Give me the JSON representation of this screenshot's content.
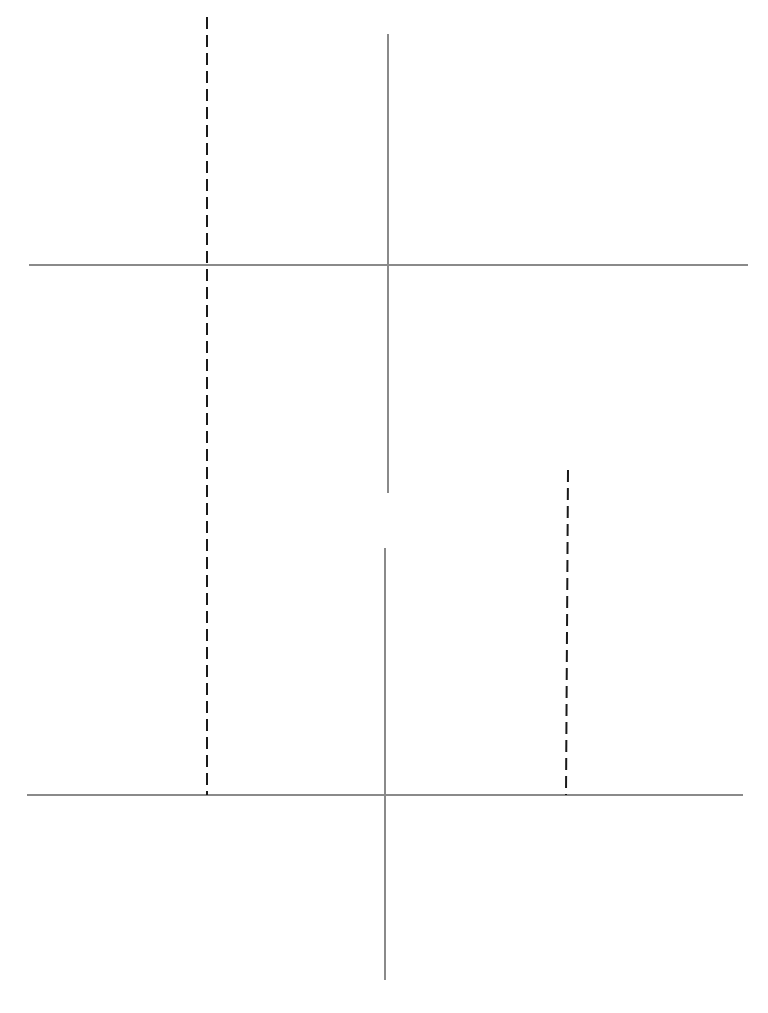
{
  "chart_data": [
    {
      "type": "line",
      "name": "top-chart",
      "title": "",
      "function": "f(x) = x^3/3 - 9x",
      "xlabel": "x",
      "ylabel": "y",
      "xlim": [
        -6,
        6
      ],
      "ylim": [
        -20,
        20
      ],
      "x_ticks": [
        "-6",
        "-4",
        "-2",
        "0",
        "2",
        "4",
        "6"
      ],
      "y_ticks": [
        "20",
        "15",
        "10",
        "5",
        "0",
        "-5",
        "-10",
        "-15",
        "-20"
      ],
      "grid": false,
      "series": [
        {
          "name": "f(x)",
          "x_range": [
            -5,
            5
          ],
          "x": [
            -5,
            -4,
            -3,
            -2,
            -1,
            0,
            1,
            2,
            3,
            4,
            5
          ],
          "y": [
            3.33,
            14.67,
            18,
            15.33,
            8.67,
            0,
            -8.67,
            -15.33,
            -18,
            -14.67,
            -3.33
          ]
        }
      ],
      "annotations": {
        "local_max": {
          "x": -3,
          "y": 18
        },
        "local_min": {
          "x": 3,
          "y": -18
        },
        "tangent_lines": [
          {
            "at": "max",
            "slope": 0,
            "x_from": -4.8,
            "x_to": -1.6
          },
          {
            "at": "left-of-max",
            "x1": -4.9,
            "y1": 8,
            "x2": -3.3,
            "y2": 21.7
          },
          {
            "at": "right-of-max",
            "x1": -2.5,
            "y1": 19.7,
            "x2": -0.8,
            "y2": 8.4
          },
          {
            "at": "min",
            "slope": 0,
            "x_from": 1.3,
            "x_to": 4.9
          },
          {
            "at": "left-of-min",
            "x1": 0.65,
            "y1": -7.7,
            "x2": 2.95,
            "y2": -21.1
          },
          {
            "at": "right-of-min",
            "x1": 3.2,
            "y1": -19.7,
            "x2": 4.7,
            "y2": -10.6
          }
        ]
      }
    },
    {
      "type": "line",
      "name": "bottom-chart",
      "title": "",
      "function": "f'(x) = x^2 - 9",
      "xlabel": "x",
      "ylabel": "y",
      "xlim": [
        -6,
        6
      ],
      "ylim": [
        -15,
        20
      ],
      "x_ticks": [
        "-6",
        "-4",
        "-2",
        "0",
        "2",
        "4",
        "6"
      ],
      "y_ticks": [
        "20",
        "15",
        "10",
        "5",
        "0",
        "-5",
        "-10",
        "-15"
      ],
      "grid": false,
      "series": [
        {
          "name": "f'(x)",
          "x_range": [
            -5,
            5
          ],
          "x": [
            -5,
            -4,
            -3,
            -2,
            -1,
            0,
            1,
            2,
            3,
            4,
            5
          ],
          "y": [
            16,
            7,
            0,
            -5,
            -8,
            -9,
            -8,
            -5,
            0,
            7,
            16
          ]
        }
      ],
      "annotations": {
        "roots": [
          -3,
          3
        ],
        "vertical_dashed_links": [
          {
            "x": -3,
            "from": "top local max (y=18)",
            "to": "bottom root (y=0)"
          },
          {
            "x": 3,
            "from": "top local min (y=-18)",
            "to": "bottom root (y=0)"
          }
        ]
      }
    }
  ],
  "labels": {
    "top_x_axis": "x",
    "top_y_axis": "y",
    "bottom_x_axis": "x",
    "bottom_y_axis": "y",
    "top_x_ticks": [
      "-6",
      "-4",
      "-2",
      "0",
      "2",
      "4",
      "6"
    ],
    "top_y_ticks": [
      "20",
      "15",
      "10",
      "5",
      "0",
      "-5",
      "-10",
      "-15",
      "-20"
    ],
    "bottom_x_ticks": [
      "-6",
      "-4",
      "-2",
      "0",
      "2",
      "4",
      "6"
    ],
    "bottom_y_ticks": [
      "20",
      "15",
      "10",
      "5",
      "0",
      "-5",
      "-10",
      "-15"
    ]
  },
  "colors": {
    "axis": "#8a8a8a",
    "curve": "#1a1a1a",
    "dashed": "#1a1a1a",
    "text": "#222222"
  }
}
